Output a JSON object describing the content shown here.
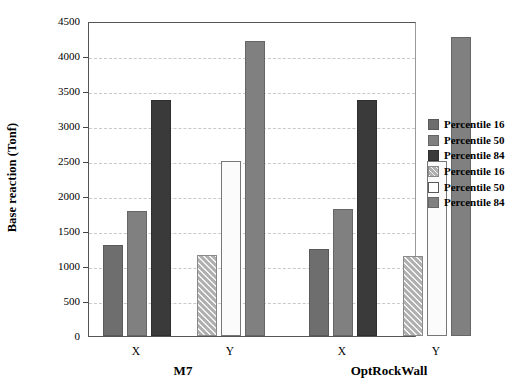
{
  "chart_data": {
    "type": "bar",
    "title": "",
    "xlabel": "",
    "ylabel": "Base reaction (Tonf)",
    "ylim": [
      0,
      4500
    ],
    "ytick_labels": [
      "0",
      "500",
      "1000",
      "1500",
      "2000",
      "2500",
      "3000",
      "3500",
      "4000",
      "4500"
    ],
    "ytick_values": [
      0,
      500,
      1000,
      1500,
      2000,
      2500,
      3000,
      3500,
      4000,
      4500
    ],
    "grid": true,
    "legend_position": "right",
    "groups": [
      {
        "label": "M7",
        "subgroups": [
          {
            "label": "X",
            "bars": [
              {
                "series": "Percentile 16",
                "value": 1300,
                "style": "solid-dark-gray"
              },
              {
                "series": "Percentile 50",
                "value": 1790,
                "style": "solid-mid-gray"
              },
              {
                "series": "Percentile 84",
                "value": 3370,
                "style": "solid-black-gray"
              }
            ]
          },
          {
            "label": "Y",
            "bars": [
              {
                "series": "Percentile 16",
                "value": 1160,
                "style": "hatched"
              },
              {
                "series": "Percentile 50",
                "value": 2500,
                "style": "white"
              },
              {
                "series": "Percentile 84",
                "value": 4220,
                "style": "solid-mid-gray2"
              }
            ]
          }
        ]
      },
      {
        "label": "OptRockWall",
        "subgroups": [
          {
            "label": "X",
            "bars": [
              {
                "series": "Percentile 16",
                "value": 1250,
                "style": "solid-dark-gray"
              },
              {
                "series": "Percentile 50",
                "value": 1810,
                "style": "solid-mid-gray"
              },
              {
                "series": "Percentile 84",
                "value": 3370,
                "style": "solid-black-gray"
              }
            ]
          },
          {
            "label": "Y",
            "bars": [
              {
                "series": "Percentile 16",
                "value": 1140,
                "style": "hatched"
              },
              {
                "series": "Percentile 50",
                "value": 2500,
                "style": "white"
              },
              {
                "series": "Percentile 84",
                "value": 4270,
                "style": "solid-mid-gray2"
              }
            ]
          }
        ]
      }
    ],
    "legend": [
      {
        "label": "Percentile 16",
        "style": "solid-dark-gray",
        "color": "#6e6e6e"
      },
      {
        "label": "Percentile 50",
        "style": "solid-mid-gray",
        "color": "#808080"
      },
      {
        "label": "Percentile 84",
        "style": "solid-black-gray",
        "color": "#3a3a3a"
      },
      {
        "label": "Percentile 16",
        "style": "hatched",
        "color": "#b0b0b0"
      },
      {
        "label": "Percentile 50",
        "style": "white",
        "color": "#ffffff"
      },
      {
        "label": "Percentile 84",
        "style": "solid-mid-gray2",
        "color": "#808080"
      }
    ]
  },
  "colors": {
    "background": "#ffffff",
    "axis": "#555555",
    "gridline": "#c9c9c9",
    "text": "#000000"
  }
}
